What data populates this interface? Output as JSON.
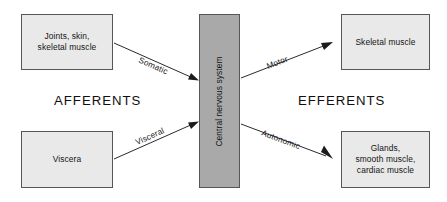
{
  "diagram": {
    "colors": {
      "peripheral_box_fill": "#e9e9e9",
      "cns_box_fill": "#a9a9a9",
      "box_border": "#55565a",
      "edge": "#2a2a2a",
      "text": "#141414",
      "background": "#ffffff"
    },
    "headings": {
      "left": "AFFERENTS",
      "right": "EFFERENTS"
    },
    "nodes": {
      "joints_skin": "Joints, skin,\nskeletal muscle",
      "viscera": "Viscera",
      "cns": "Central nervous system",
      "skeletal_muscle": "Skeletal muscle",
      "glands": "Glands,\nsmooth muscle,\ncardiac muscle"
    },
    "edges": [
      {
        "id": "somatic",
        "label": "Somatic",
        "from": "joints_skin",
        "to": "cns",
        "direction": "afferent"
      },
      {
        "id": "visceral",
        "label": "Visceral",
        "from": "viscera",
        "to": "cns",
        "direction": "afferent"
      },
      {
        "id": "motor",
        "label": "Motor",
        "from": "cns",
        "to": "skeletal_muscle",
        "direction": "efferent"
      },
      {
        "id": "autonomic",
        "label": "Autonomic",
        "from": "cns",
        "to": "glands",
        "direction": "efferent"
      }
    ]
  }
}
